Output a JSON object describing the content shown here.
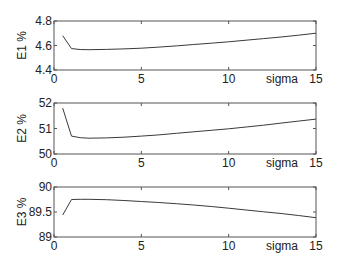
{
  "chart_data": [
    {
      "type": "line",
      "title": "",
      "xlabel": "sigma",
      "ylabel": "E1 %",
      "xlim": [
        0,
        15
      ],
      "ylim": [
        4.4,
        4.8
      ],
      "xticks": [
        "0",
        "5",
        "10",
        "15"
      ],
      "yticks": [
        "4.4",
        "4.6",
        "4.8"
      ],
      "grid": false,
      "legend": null,
      "series": [
        {
          "name": "E1",
          "x": [
            0.5,
            1,
            1.5,
            2,
            3,
            4,
            5,
            6,
            7,
            8,
            9,
            10,
            11,
            12,
            13,
            14,
            15
          ],
          "values": [
            4.68,
            4.575,
            4.567,
            4.566,
            4.568,
            4.572,
            4.578,
            4.587,
            4.597,
            4.608,
            4.619,
            4.63,
            4.643,
            4.656,
            4.669,
            4.684,
            4.7
          ]
        }
      ]
    },
    {
      "type": "line",
      "title": "",
      "xlabel": "sigma",
      "ylabel": "E2 %",
      "xlim": [
        0,
        15
      ],
      "ylim": [
        50,
        52
      ],
      "xticks": [
        "0",
        "5",
        "10",
        "15"
      ],
      "yticks": [
        "50",
        "51",
        "52"
      ],
      "grid": false,
      "legend": null,
      "series": [
        {
          "name": "E2",
          "x": [
            0.5,
            1,
            1.5,
            2,
            3,
            4,
            5,
            6,
            7,
            8,
            9,
            10,
            11,
            12,
            13,
            14,
            15
          ],
          "values": [
            51.8,
            50.7,
            50.64,
            50.62,
            50.63,
            50.66,
            50.7,
            50.75,
            50.81,
            50.87,
            50.93,
            50.99,
            51.06,
            51.13,
            51.21,
            51.29,
            51.37
          ]
        }
      ]
    },
    {
      "type": "line",
      "title": "",
      "xlabel": "sigma",
      "ylabel": "E3 %",
      "xlim": [
        0,
        15
      ],
      "ylim": [
        89,
        90
      ],
      "xticks": [
        "0",
        "5",
        "10",
        "15"
      ],
      "yticks": [
        "89",
        "89.5",
        "90"
      ],
      "grid": false,
      "legend": null,
      "series": [
        {
          "name": "E3",
          "x": [
            0.5,
            1,
            1.5,
            2,
            3,
            4,
            5,
            6,
            7,
            8,
            9,
            10,
            11,
            12,
            13,
            14,
            15
          ],
          "values": [
            89.44,
            89.75,
            89.755,
            89.755,
            89.745,
            89.73,
            89.71,
            89.69,
            89.665,
            89.64,
            89.61,
            89.575,
            89.54,
            89.505,
            89.47,
            89.43,
            89.385
          ]
        }
      ]
    }
  ],
  "axes": [
    {
      "ylabel": "E1 %",
      "xlabel": "sigma",
      "xticks": [
        "0",
        "5",
        "10",
        "15"
      ],
      "yticks": [
        "4.4",
        "4.6",
        "4.8"
      ]
    },
    {
      "ylabel": "E2 %",
      "xlabel": "sigma",
      "xticks": [
        "0",
        "5",
        "10",
        "15"
      ],
      "yticks": [
        "50",
        "51",
        "52"
      ]
    },
    {
      "ylabel": "E3 %",
      "xlabel": "sigma",
      "xticks": [
        "0",
        "5",
        "10",
        "15"
      ],
      "yticks": [
        "89",
        "89.5",
        "90"
      ]
    }
  ],
  "colors": {
    "line": "#3a3a3a",
    "axes": "#555555",
    "text": "#222222",
    "background": "#ffffff"
  }
}
